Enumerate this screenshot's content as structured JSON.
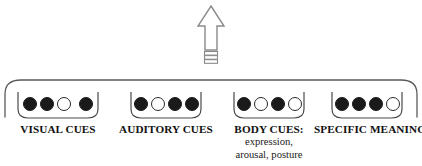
{
  "figure": {
    "arrow": {
      "name": "upward-arrow",
      "direction": "up",
      "style": "outlined with ribbed tail",
      "color": "#7a7a7a"
    },
    "outer_bracket": {
      "name": "outer-brace",
      "color": "#555555"
    }
  },
  "groups": [
    {
      "label": "VISUAL CUES",
      "sublabel": "",
      "dots": [
        "filled",
        "filled",
        "hollow",
        "filled"
      ],
      "gap_before_last": true
    },
    {
      "label": "AUDITORY CUES",
      "sublabel": "",
      "dots": [
        "filled",
        "hollow",
        "filled",
        "filled"
      ],
      "gap_before_last": false
    },
    {
      "label": "BODY CUES:",
      "sublabel": "expression,\narousal, posture",
      "sublabel_line1": "expression,",
      "sublabel_line2": "arousal, posture",
      "dots": [
        "filled",
        "hollow",
        "filled",
        "hollow"
      ],
      "gap_before_last": false
    },
    {
      "label": "SPECIFIC MEANINGS",
      "sublabel": "",
      "dots": [
        "filled",
        "filled",
        "filled",
        "hollow"
      ],
      "gap_before_last": false
    }
  ],
  "colors": {
    "dot_filled": "#1a1a1a",
    "dot_hollow_border": "#2b2b2b",
    "text": "#111111",
    "brace": "#555555",
    "background": "#ffffff"
  }
}
